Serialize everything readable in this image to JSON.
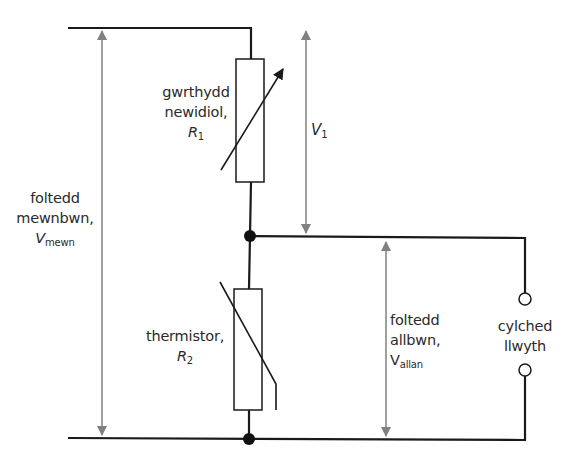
{
  "diagram": {
    "type": "potential divider circuit",
    "colors": {
      "wire": "#1a1a1a",
      "arrow": "#808080",
      "text": "#2a2a2a",
      "background": "#ffffff"
    },
    "components": {
      "variable_resistor": {
        "line1": "gwrthydd",
        "line2": "newidiol,",
        "symbol": "R",
        "subscript": "1"
      },
      "thermistor": {
        "line1": "thermistor,",
        "symbol": "R",
        "subscript": "2"
      }
    },
    "voltages": {
      "input": {
        "line1": "foltedd",
        "line2": "mewnbwn,",
        "symbol": "V",
        "subscript": "mewn"
      },
      "v1": {
        "symbol": "V",
        "subscript": "1"
      },
      "output": {
        "line1": "foltedd",
        "line2": "allbwn,",
        "symbol": "V",
        "subscript": "allan"
      }
    },
    "load": {
      "line1": "cylched",
      "line2": "llwyth"
    }
  }
}
